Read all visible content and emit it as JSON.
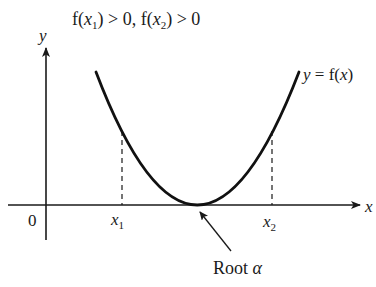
{
  "title": {
    "f_open": "f(",
    "var1": "x",
    "sub1": "1",
    "mid": ") > 0, f(",
    "var2": "x",
    "sub2": "2",
    "close": ") > 0"
  },
  "axes": {
    "y_label": "y",
    "x_label": "x",
    "origin_label": "0"
  },
  "curve": {
    "label_y": "y",
    "label_eq": " = f(",
    "label_x": "x",
    "label_close": ")",
    "color": "#111111"
  },
  "markers": {
    "x1": {
      "var": "x",
      "sub": "1"
    },
    "x2": {
      "var": "x",
      "sub": "2"
    }
  },
  "annotation": {
    "text": "Root ",
    "symbol": "α"
  },
  "colors": {
    "ink": "#1a1a1a",
    "background": "#ffffff"
  }
}
